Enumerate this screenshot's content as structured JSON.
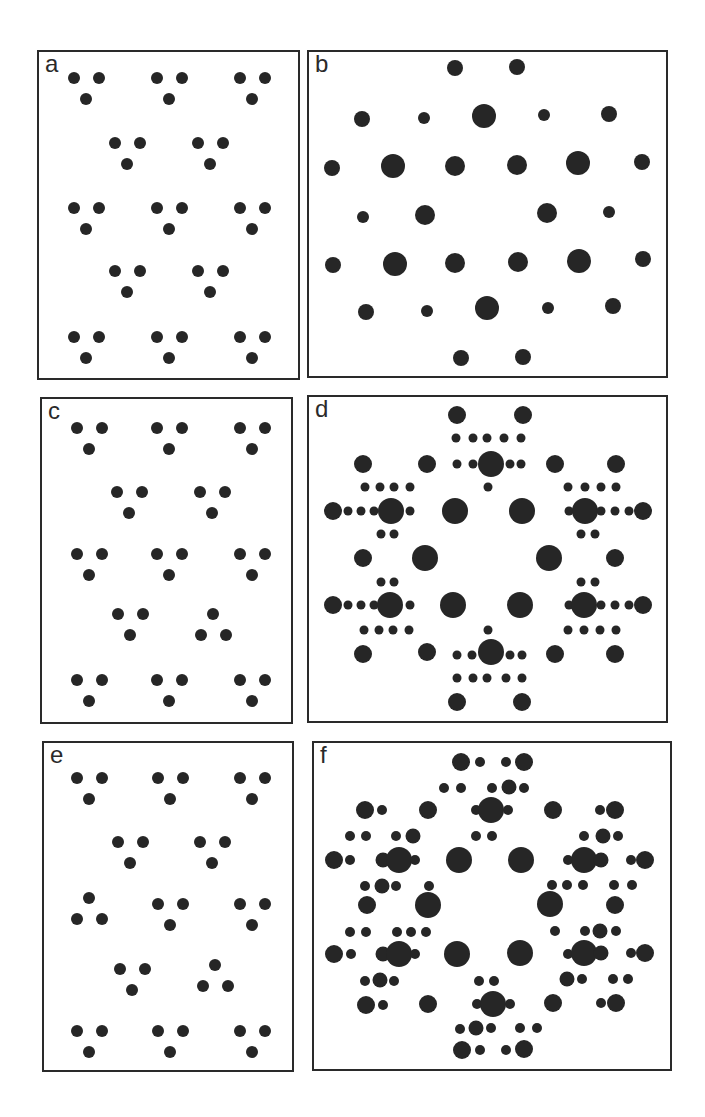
{
  "figure": {
    "panels": [
      {
        "id": "a",
        "label": "a",
        "box": [
          37,
          50,
          300,
          380
        ]
      },
      {
        "id": "b",
        "label": "b",
        "box": [
          307,
          50,
          668,
          378
        ]
      },
      {
        "id": "c",
        "label": "c",
        "box": [
          40,
          397,
          293,
          724
        ]
      },
      {
        "id": "d",
        "label": "d",
        "box": [
          307,
          395,
          668,
          723
        ]
      },
      {
        "id": "e",
        "label": "e",
        "box": [
          42,
          741,
          294,
          1072
        ]
      },
      {
        "id": "f",
        "label": "f",
        "box": [
          312,
          741,
          672,
          1071
        ]
      }
    ],
    "dot_color": "#262626",
    "border_color": "#2a2a2a"
  }
}
